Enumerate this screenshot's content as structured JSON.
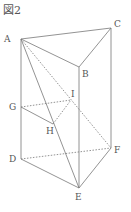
{
  "figure": {
    "title": "図2",
    "points": {
      "A": {
        "label": "A",
        "x": 21,
        "y": 39,
        "lx": 4,
        "ly": 42
      },
      "B": {
        "label": "B",
        "x": 79,
        "y": 67,
        "lx": 82,
        "ly": 77
      },
      "C": {
        "label": "C",
        "x": 111,
        "y": 28,
        "lx": 114,
        "ly": 27
      },
      "D": {
        "label": "D",
        "x": 21,
        "y": 159,
        "lx": 9,
        "ly": 162
      },
      "E": {
        "label": "E",
        "x": 79,
        "y": 188,
        "lx": 75,
        "ly": 200
      },
      "F": {
        "label": "F",
        "x": 111,
        "y": 148,
        "lx": 114,
        "ly": 153
      },
      "G": {
        "label": "G",
        "x": 21,
        "y": 107,
        "lx": 9,
        "ly": 110
      },
      "H": {
        "label": "H",
        "x": 53,
        "y": 124,
        "lx": 46,
        "ly": 134
      },
      "I": {
        "label": "I",
        "x": 71,
        "y": 100,
        "lx": 71,
        "ly": 97
      }
    },
    "solid_edges": [
      [
        "A",
        "C"
      ],
      [
        "A",
        "B"
      ],
      [
        "B",
        "C"
      ],
      [
        "A",
        "D"
      ],
      [
        "B",
        "E"
      ],
      [
        "C",
        "F"
      ],
      [
        "D",
        "E"
      ],
      [
        "E",
        "F"
      ],
      [
        "A",
        "E"
      ],
      [
        "G",
        "H"
      ]
    ],
    "dashed_edges": [
      [
        "A",
        "F"
      ],
      [
        "G",
        "I"
      ],
      [
        "H",
        "I"
      ],
      [
        "D",
        "F"
      ]
    ],
    "line_color": "#777777"
  }
}
